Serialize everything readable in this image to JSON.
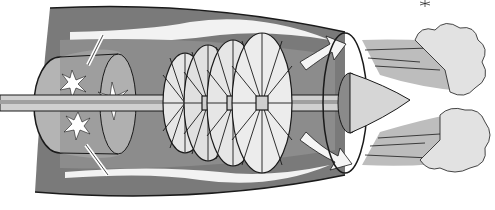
{
  "image": {
    "subject": "jet engine cutaway illustration",
    "style": "grayscale watercolor drawing",
    "colors": {
      "background": "#ffffff",
      "casing_dark": "#6e6e6e",
      "casing_mid": "#9a9a9a",
      "light": "#d8d8d8",
      "ink": "#1a1a1a"
    },
    "parts": [
      "intake-casing",
      "combustion-chamber",
      "shaft",
      "turbine-discs",
      "airflow-arrows",
      "exhaust-cone",
      "exhaust-clouds"
    ]
  }
}
